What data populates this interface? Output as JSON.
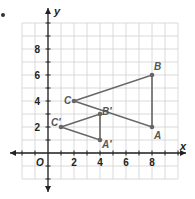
{
  "chart_data": {
    "type": "scatter",
    "title": "",
    "xlabel": "x",
    "ylabel": "y",
    "origin_label": "O",
    "xlim": [
      -2,
      10
    ],
    "ylim": [
      -2,
      10
    ],
    "grid": true,
    "x_ticks": [
      2,
      4,
      6,
      8
    ],
    "y_ticks": [
      2,
      4,
      6,
      8
    ],
    "shapes": [
      {
        "name": "Triangle ABC",
        "points": [
          {
            "label": "A",
            "x": 8,
            "y": 2
          },
          {
            "label": "B",
            "x": 8,
            "y": 6
          },
          {
            "label": "C",
            "x": 2,
            "y": 4
          }
        ]
      },
      {
        "name": "Triangle A'B'C'",
        "points": [
          {
            "label": "A′",
            "x": 4,
            "y": 1
          },
          {
            "label": "B′",
            "x": 4,
            "y": 3
          },
          {
            "label": "C′",
            "x": 1,
            "y": 2
          }
        ]
      }
    ]
  },
  "colors": {
    "grid": "#d0d0d0",
    "axis": "#222222",
    "shape": "#666666",
    "label": "#555555",
    "tick_label": "#222222"
  }
}
